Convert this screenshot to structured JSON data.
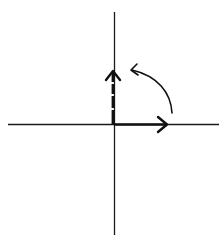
{
  "diagram": {
    "rotation": {
      "angle_degrees": 90,
      "direction": "counterclockwise"
    },
    "colors": {
      "background": "#ffffff",
      "axis": "#1a1a1a",
      "vector": "#111111"
    },
    "elements": [
      {
        "name": "x-axis",
        "kind": "line"
      },
      {
        "name": "y-axis",
        "kind": "line"
      },
      {
        "name": "horizontal-vector",
        "kind": "arrow",
        "style": "solid"
      },
      {
        "name": "vertical-vector",
        "kind": "arrow",
        "style": "dashed"
      },
      {
        "name": "rotation-arrow",
        "kind": "curved-arrow",
        "style": "solid"
      }
    ]
  }
}
